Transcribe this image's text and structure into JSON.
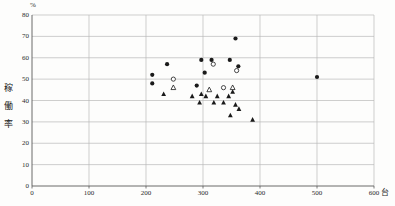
{
  "chart": {
    "percent_label": "%",
    "unit_label": "台",
    "y_axis_title_chars": [
      "稼",
      "働",
      "率"
    ],
    "colors": {
      "marker": "#1a1a1a",
      "grid": "#b9b9b9",
      "axis": "#5a5a5a",
      "background": "#fdfdfc"
    }
  },
  "chart_data": {
    "type": "scatter",
    "title": "",
    "xlabel": "台",
    "ylabel": "稼働率 (%)",
    "xlim": [
      0,
      600
    ],
    "ylim": [
      0,
      80
    ],
    "x_ticks": [
      0,
      100,
      200,
      300,
      400,
      500,
      600
    ],
    "y_ticks": [
      0,
      10,
      20,
      30,
      40,
      50,
      60,
      70,
      80
    ],
    "grid": true,
    "legend_position": "none",
    "series": [
      {
        "name": "filled-circle",
        "marker": "circle",
        "filled": true,
        "points": [
          [
            211,
            52
          ],
          [
            211,
            48
          ],
          [
            237,
            57
          ],
          [
            289,
            47
          ],
          [
            297,
            59
          ],
          [
            303,
            53
          ],
          [
            315,
            59
          ],
          [
            347,
            59
          ],
          [
            357,
            69
          ],
          [
            362,
            56
          ],
          [
            500,
            51
          ]
        ]
      },
      {
        "name": "open-circle",
        "marker": "circle",
        "filled": false,
        "points": [
          [
            248,
            50
          ],
          [
            318,
            57
          ],
          [
            336,
            46
          ],
          [
            359,
            54
          ]
        ]
      },
      {
        "name": "filled-triangle",
        "marker": "triangle",
        "filled": true,
        "points": [
          [
            231,
            43
          ],
          [
            281,
            42
          ],
          [
            294,
            39
          ],
          [
            297,
            43
          ],
          [
            305,
            42
          ],
          [
            319,
            39
          ],
          [
            325,
            42
          ],
          [
            336,
            39
          ],
          [
            345,
            42
          ],
          [
            348,
            33
          ],
          [
            352,
            44
          ],
          [
            357,
            38
          ],
          [
            363,
            36
          ],
          [
            387,
            31
          ]
        ]
      },
      {
        "name": "open-triangle",
        "marker": "triangle",
        "filled": false,
        "points": [
          [
            248,
            46
          ],
          [
            311,
            45
          ],
          [
            352,
            46
          ]
        ]
      }
    ]
  }
}
